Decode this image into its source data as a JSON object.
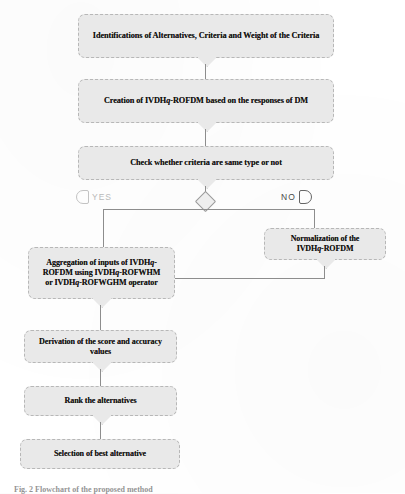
{
  "document": {
    "type": "flowchart",
    "caption": "Fig. 2 Flowchart of the proposed method",
    "top_partial_text": ""
  },
  "flowchart": {
    "nodes": [
      {
        "id": "identification",
        "name": "identification-box",
        "shape": "process",
        "text": "Identifications of Alternatives, Criteria and Weight of the Criteria"
      },
      {
        "id": "creation",
        "name": "creation-box",
        "shape": "process",
        "text_a": "Creation of IVDH",
        "text_q": "q",
        "text_b": "-ROFDM based on the responses of DM"
      },
      {
        "id": "check",
        "name": "check-criteria-box",
        "shape": "process",
        "text": "Check whether criteria are same type or not"
      },
      {
        "id": "decision",
        "name": "decision-diamond",
        "shape": "decision",
        "text": ""
      },
      {
        "id": "aggregation",
        "name": "aggregation-box",
        "shape": "process",
        "line1_a": "Aggregation of inputs of IVDH",
        "line1_q": "q",
        "line1_b": "-",
        "line2_a": "ROFDM using IVDH",
        "line2_q": "q",
        "line2_b": "-ROFWHM",
        "line3_a": "or IVDH",
        "line3_q": "q",
        "line3_b": "-ROFWGHM operator"
      },
      {
        "id": "normalization",
        "name": "normalization-box",
        "shape": "process",
        "line1": "Normalization of the",
        "line2_a": "IVDH",
        "line2_q": "q",
        "line2_b": "-ROFDM"
      },
      {
        "id": "derivation",
        "name": "derivation-box",
        "shape": "process",
        "text": "Derivation of the score and accuracy values"
      },
      {
        "id": "rank",
        "name": "rank-box",
        "shape": "process",
        "text": "Rank the alternatives"
      },
      {
        "id": "selection",
        "name": "selection-box",
        "shape": "process",
        "text": "Selection of best alternative"
      }
    ],
    "branches": {
      "yes_label": "YES",
      "no_label": "NO"
    },
    "colors": {
      "node_fill": "#e9e9e9",
      "node_border": "#b7b7b7",
      "connector": "#8d8d8d",
      "text": "#12100e",
      "yes_text": "#b9b9b9",
      "no_text": "#4a4a4a",
      "page": "#ffffff"
    }
  }
}
